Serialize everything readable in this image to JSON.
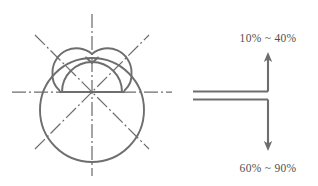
{
  "figure": {
    "stroke_color": "#6e6e6e",
    "centerline_color": "#6e6e6e",
    "text_color": "#4f4f4f",
    "background_color": "#ffffff"
  },
  "geometry": {
    "large_circle": {
      "cx": 92,
      "cy": 110,
      "r": 52
    },
    "left_lobe": {
      "cx": 73,
      "cy": 72,
      "r": 24
    },
    "right_lobe": {
      "cx": 112,
      "cy": 72,
      "r": 24
    },
    "dome_arc": {
      "cx": 92,
      "cy": 92,
      "r": 30
    },
    "baseline": {
      "x1": 62,
      "y1": 92,
      "x2": 122,
      "y2": 92
    },
    "center_point": {
      "x": 92,
      "y": 92
    },
    "centerlines": [
      {
        "name": "vertical-centerline",
        "angle_deg": 90
      },
      {
        "name": "horizontal-centerline",
        "angle_deg": 0
      },
      {
        "name": "diagonal-centerline-45",
        "angle_deg": 45
      },
      {
        "name": "diagonal-centerline-135",
        "angle_deg": 135
      }
    ],
    "centerline_dash_pattern": "14 3 2 3"
  },
  "callout": {
    "upper": {
      "label": "10% ~ 40%",
      "direction": "up",
      "arrow_tip": {
        "x": 268,
        "y": 55
      },
      "arrow_tail": {
        "x": 268,
        "y": 92
      }
    },
    "lower": {
      "label": "60% ~ 90%",
      "direction": "down",
      "arrow_tip": {
        "x": 268,
        "y": 148
      },
      "arrow_tail": {
        "x": 268,
        "y": 99
      }
    },
    "extension_lines": [
      {
        "name": "upper-extension-line",
        "x1": 193,
        "y1": 92,
        "x2": 268,
        "y2": 92
      },
      {
        "name": "lower-extension-line",
        "x1": 193,
        "y1": 99,
        "x2": 268,
        "y2": 99
      }
    ]
  }
}
